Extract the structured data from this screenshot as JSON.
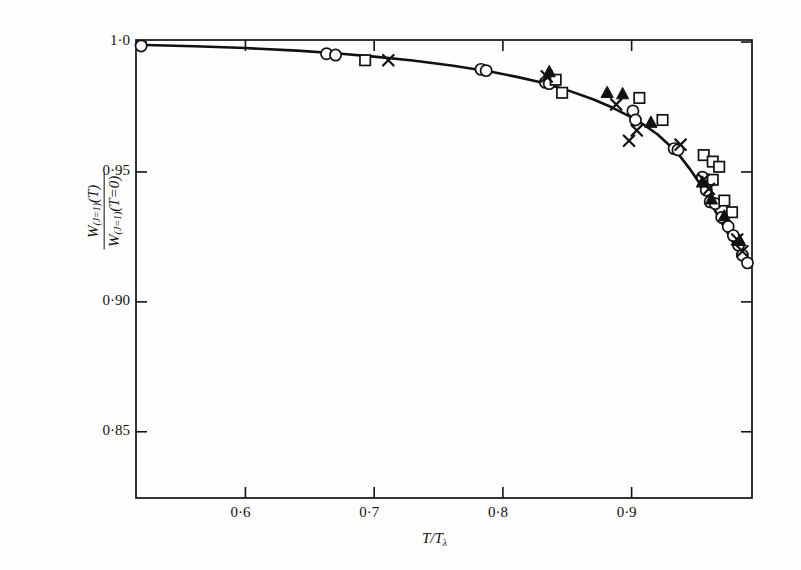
{
  "figure": {
    "background": "#fefefe",
    "ink": "#111111"
  },
  "chart_data": {
    "type": "scatter",
    "title": "",
    "subtitle": "",
    "xlabel": "T/Tλ",
    "ylabel": "W(J=1)(T) / W(J=1)(T=0)",
    "ylabel_numerator": "W",
    "ylabel_numerator_sub": "(J=1)",
    "ylabel_numerator_arg": "(T)",
    "ylabel_denominator": "W",
    "ylabel_denominator_sub": "(J=1)",
    "ylabel_denominator_arg": "(T=0)",
    "xlim": [
      0.515,
      0.9935
    ],
    "ylim": [
      0.8245,
      1.0008
    ],
    "grid": false,
    "legend_position": "none",
    "xticks": [
      0.6,
      0.7,
      0.8,
      0.9
    ],
    "xticklabels": [
      "0·6",
      "0·7",
      "0·8",
      "0·9"
    ],
    "yticks": [
      1.0,
      0.95,
      0.9,
      0.85
    ],
    "yticklabels": [
      "1·0",
      "0·95",
      "0·90",
      "0·85"
    ],
    "series": [
      {
        "name": "open-circle",
        "marker": "circle",
        "fill": "none",
        "points": [
          [
            0.519,
            0.9985
          ],
          [
            0.663,
            0.9955
          ],
          [
            0.67,
            0.995
          ],
          [
            0.783,
            0.9895
          ],
          [
            0.787,
            0.989
          ],
          [
            0.833,
            0.9845
          ],
          [
            0.836,
            0.984
          ],
          [
            0.901,
            0.9735
          ],
          [
            0.903,
            0.97
          ],
          [
            0.933,
            0.959
          ],
          [
            0.936,
            0.9585
          ],
          [
            0.955,
            0.948
          ],
          [
            0.958,
            0.943
          ],
          [
            0.961,
            0.9385
          ],
          [
            0.965,
            0.9378
          ],
          [
            0.97,
            0.9325
          ],
          [
            0.975,
            0.929
          ],
          [
            0.979,
            0.9255
          ],
          [
            0.983,
            0.9218
          ],
          [
            0.986,
            0.918
          ],
          [
            0.99,
            0.915
          ]
        ]
      },
      {
        "name": "open-square",
        "marker": "square",
        "fill": "none",
        "points": [
          [
            0.693,
            0.993
          ],
          [
            0.841,
            0.9855
          ],
          [
            0.846,
            0.9805
          ],
          [
            0.906,
            0.9785
          ],
          [
            0.924,
            0.97
          ],
          [
            0.956,
            0.9565
          ],
          [
            0.963,
            0.954
          ],
          [
            0.968,
            0.952
          ],
          [
            0.963,
            0.947
          ],
          [
            0.972,
            0.939
          ],
          [
            0.978,
            0.9345
          ]
        ]
      },
      {
        "name": "filled-triangle",
        "marker": "triangle",
        "fill": "solid",
        "points": [
          [
            0.836,
            0.9885
          ],
          [
            0.881,
            0.9805
          ],
          [
            0.893,
            0.98
          ],
          [
            0.915,
            0.969
          ],
          [
            0.955,
            0.946
          ],
          [
            0.962,
            0.9395
          ],
          [
            0.972,
            0.933
          ],
          [
            0.984,
            0.9235
          ]
        ]
      },
      {
        "name": "cross",
        "marker": "cross",
        "fill": "none",
        "points": [
          [
            0.711,
            0.993
          ],
          [
            0.834,
            0.9868
          ],
          [
            0.888,
            0.976
          ],
          [
            0.904,
            0.966
          ],
          [
            0.898,
            0.962
          ],
          [
            0.938,
            0.9605
          ],
          [
            0.956,
            0.947
          ],
          [
            0.96,
            0.9435
          ],
          [
            0.982,
            0.924
          ],
          [
            0.986,
            0.9195
          ]
        ]
      }
    ],
    "curve": {
      "name": "theory-curve",
      "points": [
        [
          0.515,
          0.999
        ],
        [
          0.56,
          0.9984
        ],
        [
          0.6,
          0.9977
        ],
        [
          0.64,
          0.9967
        ],
        [
          0.67,
          0.9957
        ],
        [
          0.7,
          0.9944
        ],
        [
          0.73,
          0.9929
        ],
        [
          0.76,
          0.991
        ],
        [
          0.79,
          0.9887
        ],
        [
          0.81,
          0.9867
        ],
        [
          0.83,
          0.9844
        ],
        [
          0.85,
          0.9815
        ],
        [
          0.87,
          0.978
        ],
        [
          0.885,
          0.9748
        ],
        [
          0.9,
          0.971
        ],
        [
          0.91,
          0.968
        ],
        [
          0.92,
          0.9645
        ],
        [
          0.93,
          0.96
        ],
        [
          0.938,
          0.9558
        ],
        [
          0.945,
          0.9513
        ],
        [
          0.952,
          0.9462
        ],
        [
          0.958,
          0.9412
        ],
        [
          0.963,
          0.9368
        ],
        [
          0.968,
          0.9322
        ],
        [
          0.972,
          0.9287
        ],
        [
          0.976,
          0.9253
        ],
        [
          0.98,
          0.922
        ],
        [
          0.984,
          0.9188
        ],
        [
          0.988,
          0.9157
        ],
        [
          0.9915,
          0.9132
        ]
      ]
    }
  },
  "geometry": {
    "plot_left": 136,
    "plot_right": 752,
    "plot_top": 40,
    "plot_bottom": 498
  }
}
